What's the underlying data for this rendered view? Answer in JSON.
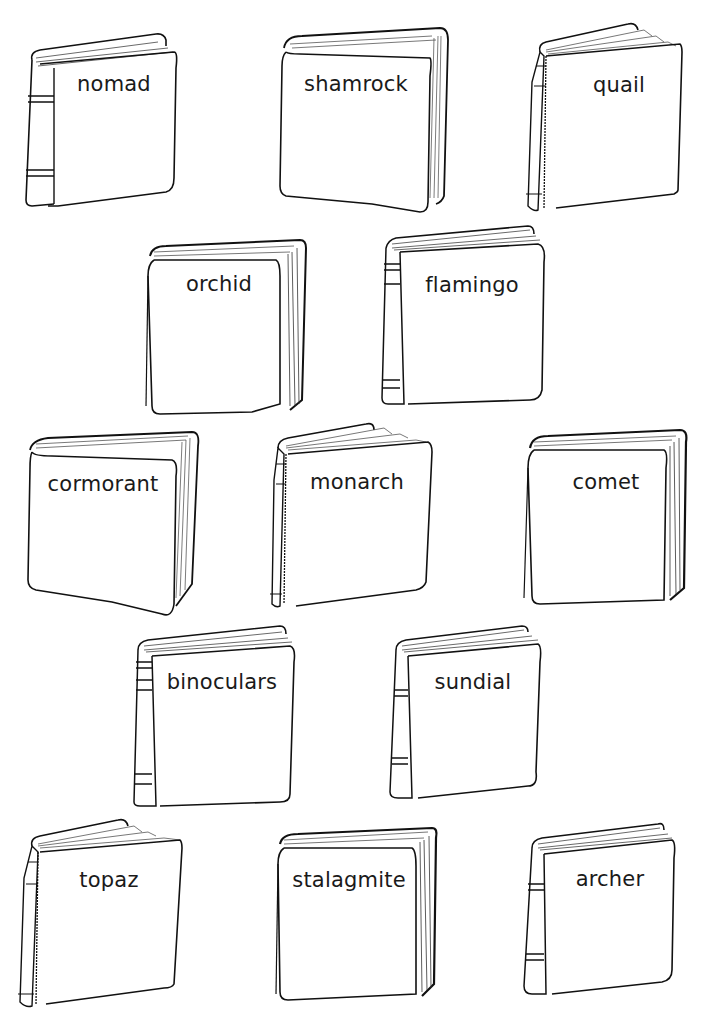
{
  "worksheet": {
    "books": [
      {
        "id": "nomad",
        "label": "nomad",
        "style": "spine-left"
      },
      {
        "id": "shamrock",
        "label": "shamrock",
        "style": "pages-right"
      },
      {
        "id": "quail",
        "label": "quail",
        "style": "fanned-left"
      },
      {
        "id": "orchid",
        "label": "orchid",
        "style": "pages-right"
      },
      {
        "id": "flamingo",
        "label": "flamingo",
        "style": "spine-left"
      },
      {
        "id": "cormorant",
        "label": "cormorant",
        "style": "pages-right"
      },
      {
        "id": "monarch",
        "label": "monarch",
        "style": "fanned-left"
      },
      {
        "id": "comet",
        "label": "comet",
        "style": "pages-right"
      },
      {
        "id": "binoculars",
        "label": "binoculars",
        "style": "spine-left"
      },
      {
        "id": "sundial",
        "label": "sundial",
        "style": "spine-left"
      },
      {
        "id": "topaz",
        "label": "topaz",
        "style": "fanned-left"
      },
      {
        "id": "stalagmite",
        "label": "stalagmite",
        "style": "pages-right"
      },
      {
        "id": "archer",
        "label": "archer",
        "style": "spine-left"
      }
    ]
  }
}
